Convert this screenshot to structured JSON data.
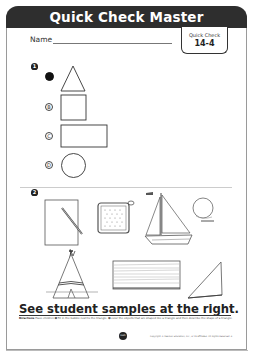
{
  "header": {
    "title": "Quick Check Master",
    "name_label": "Name",
    "quick_check_label": "Quick Check",
    "quick_check_number": "14-4"
  },
  "item1": {
    "marker": "1",
    "options": [
      {
        "letter": "A",
        "shape": "triangle",
        "selected": true
      },
      {
        "letter": "B",
        "shape": "square",
        "selected": false
      },
      {
        "letter": "C",
        "shape": "rectangle",
        "selected": false
      },
      {
        "letter": "D",
        "shape": "circle",
        "selected": false
      }
    ],
    "bubble_labels": {
      "b": "B",
      "c": "C",
      "d": "D"
    }
  },
  "item2": {
    "marker": "2",
    "objects": [
      "paper-with-pencil",
      "pot-holder",
      "sailboat",
      "ball",
      "teepee",
      "wood-board",
      "triangle-ruler"
    ]
  },
  "footer": {
    "sample_note": "See student samples at the right.",
    "directions_label": "Directions",
    "directions_text": "Have children ➊ fill in the bubble next to the triangle. ➋ color the objects that are shaped like a triangle and then describe the shape of a triangle.",
    "logo_text": "Math",
    "copyright": "Copyright © Pearson Education, Inc., or its affiliates. All Rights Reserved. 4"
  }
}
